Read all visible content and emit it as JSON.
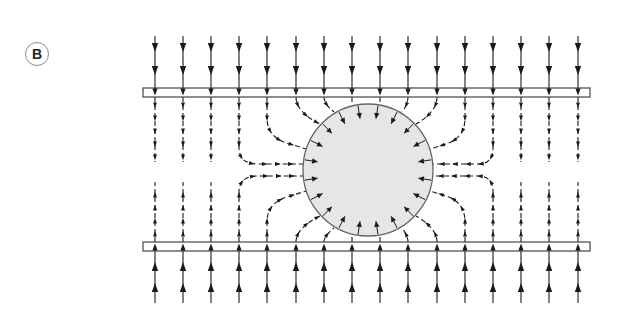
{
  "figure": {
    "panel_label": "B",
    "colors": {
      "background": "#ffffff",
      "line": "#1a1a1a",
      "sphere_fill": "#e6e6e6",
      "sphere_stroke": "#666666",
      "plate_stroke": "#444444"
    },
    "plates": [
      {
        "name": "top-plate",
        "x": 143,
        "y": 88,
        "width": 447,
        "height": 9
      },
      {
        "name": "bottom-plate",
        "x": 143,
        "y": 242,
        "width": 447,
        "height": 9
      }
    ],
    "sphere": {
      "cx": 368,
      "cy": 170,
      "rx": 65,
      "ry": 66
    },
    "field_line_columns_x": [
      155,
      183,
      211,
      239,
      267,
      296,
      324,
      352,
      380,
      408,
      437,
      465,
      493,
      521,
      549,
      578
    ],
    "field_direction": "toward-sphere"
  }
}
